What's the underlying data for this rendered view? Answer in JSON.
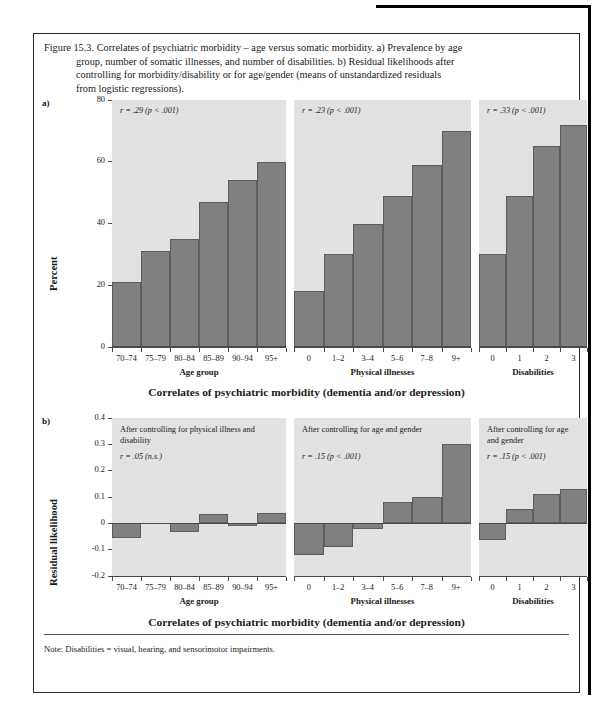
{
  "caption": {
    "lines": [
      "Figure 15.3. Correlates of psychiatric morbidity – age versus somatic morbidity. a) Prevalence by age",
      "group, number of somatic illnesses, and number of disabilities. b) Residual likelihoods after",
      "controlling for morbidity/disability or for age/gender (means of unstandardized residuals",
      "from logistic regressions)."
    ]
  },
  "note": "Note: Disabilities = visual, hearing, and sensorimotor impairments.",
  "panel_a_label": "a)",
  "panel_b_label": "b)",
  "overall_title": "Correlates of psychiatric morbidity (dementia and/or depression)",
  "axis_titles": {
    "age": "Age group",
    "illness": "Physical illnesses",
    "disability": "Disabilities"
  },
  "chart_data": [
    {
      "type": "bar",
      "id": "panel-a",
      "title": "Correlates of psychiatric morbidity (dementia and/or depression)",
      "ylabel": "Percent",
      "ylim": [
        0,
        80
      ],
      "yticks": [
        "0",
        "20",
        "40",
        "60",
        "80"
      ],
      "grid": false,
      "legend": "none",
      "subpanels": [
        {
          "xlabel": "Age group",
          "annotation": "r = .29 (p < .001)",
          "categories": [
            "70–74",
            "75–79",
            "80–84",
            "85–89",
            "90–94",
            "95+"
          ],
          "values": [
            21,
            31,
            35,
            47,
            54,
            60
          ]
        },
        {
          "xlabel": "Physical illnesses",
          "annotation": "r = .23 (p < .001)",
          "categories": [
            "0",
            "1–2",
            "3–4",
            "5–6",
            "7–8",
            "9+"
          ],
          "values": [
            18,
            30,
            40,
            49,
            59,
            70
          ]
        },
        {
          "xlabel": "Disabilities",
          "annotation": "r = .33 (p < .001)",
          "categories": [
            "0",
            "1",
            "2",
            "3"
          ],
          "values": [
            30,
            49,
            65,
            72
          ]
        }
      ]
    },
    {
      "type": "bar",
      "id": "panel-b",
      "title": "Correlates of psychiatric morbidity (dementia and/or depression)",
      "ylabel": "Residual likelihood",
      "ylim": [
        -0.2,
        0.4
      ],
      "yticks": [
        "-0.2",
        "-0.1",
        "0",
        "0.1",
        "0.2",
        "0.3",
        "0.4"
      ],
      "grid": false,
      "legend": "none",
      "subpanels": [
        {
          "xlabel": "Age group",
          "note": "After controlling for physical illness and disability",
          "annotation": "r = .05 (n.s.)",
          "categories": [
            "70–74",
            "75–79",
            "80–84",
            "85–89",
            "90–94",
            "95+"
          ],
          "values": [
            -0.055,
            0.0,
            -0.032,
            0.037,
            -0.009,
            0.038
          ]
        },
        {
          "xlabel": "Physical illnesses",
          "note": "After controlling for age and gender",
          "annotation": "r = .15 (p < .001)",
          "categories": [
            "0",
            "1–2",
            "3–4",
            "5–6",
            "7–8",
            "9+"
          ],
          "values": [
            -0.122,
            -0.09,
            -0.022,
            0.08,
            0.1,
            0.3
          ]
        },
        {
          "xlabel": "Disabilities",
          "note": "After controlling for age and gender",
          "annotation": "r = .15 (p < .001)",
          "categories": [
            "0",
            "1",
            "2",
            "3"
          ],
          "values": [
            -0.065,
            0.055,
            0.11,
            0.13
          ]
        }
      ]
    }
  ],
  "colors": {
    "bar": "#808080",
    "panel_bg": "#e2e2e2",
    "axis": "#4a4a4a"
  }
}
